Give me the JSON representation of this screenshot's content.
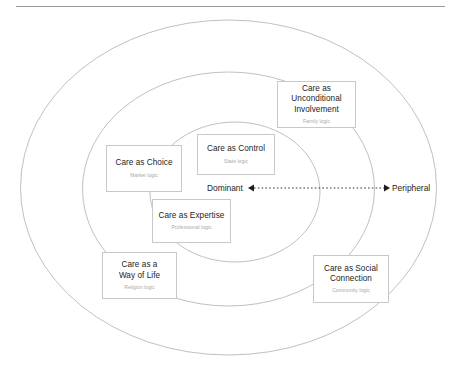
{
  "diagram": {
    "title_rule": "horizontal-divider",
    "axis": {
      "left_label": "Dominant",
      "right_label": "Peripheral",
      "style": "dotted double-headed arrow"
    },
    "rings": [
      {
        "name": "outer-ring",
        "label": "peripheral-zone"
      },
      {
        "name": "middle-ring",
        "label": "intermediate-zone"
      },
      {
        "name": "inner-ring",
        "label": "dominant-core"
      }
    ],
    "nodes": [
      {
        "id": "care-as-unconditional-involvement",
        "title": "Care as\nUnconditional\nInvolvement",
        "subtitle": "Family logic"
      },
      {
        "id": "care-as-control",
        "title": "Care as Control",
        "subtitle": "State logic"
      },
      {
        "id": "care-as-choice",
        "title": "Care as Choice",
        "subtitle": "Market logic"
      },
      {
        "id": "care-as-expertise",
        "title": "Care as Expertise",
        "subtitle": "Professional logic"
      },
      {
        "id": "care-as-a-way-of-life",
        "title": "Care as a\nWay of Life",
        "subtitle": "Religion logic"
      },
      {
        "id": "care-as-social-connection",
        "title": "Care as Social\nConnection",
        "subtitle": "Community logic"
      }
    ],
    "colors": {
      "ring_stroke": "#b9b9b9",
      "box_stroke": "#c8c8c8",
      "title_text": "#1d1d1d",
      "subtitle_text": "#a8a8a8",
      "rule": "#9a9a9a",
      "background": "#ffffff"
    }
  }
}
